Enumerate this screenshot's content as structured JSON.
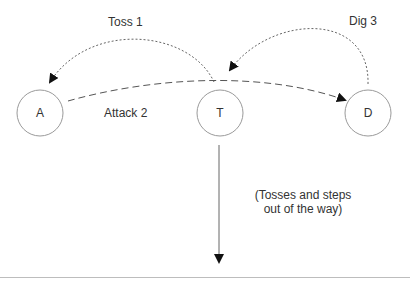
{
  "nodes": [
    {
      "id": "A",
      "label": "A"
    },
    {
      "id": "T",
      "label": "T"
    },
    {
      "id": "D",
      "label": "D"
    }
  ],
  "edges": [
    {
      "label": "Toss 1",
      "from": "T",
      "to": "A",
      "style": "dotted"
    },
    {
      "label": "Attack 2",
      "from": "A",
      "to": "D",
      "style": "dashed"
    },
    {
      "label": "Dig 3",
      "from": "D",
      "to": "T",
      "style": "dotted"
    }
  ],
  "note": {
    "line1": "(Tosses and steps",
    "line2": "out of the way)"
  },
  "colors": {
    "stroke": "#9a9a9a",
    "arrow": "#111111",
    "text": "#333333"
  }
}
